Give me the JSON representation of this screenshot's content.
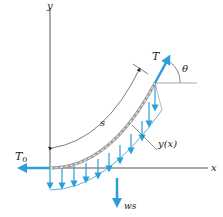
{
  "diagram": {
    "colors": {
      "axis": "#555555",
      "arrow": "#2a9fd8",
      "cable": "#888888",
      "text": "#222222"
    },
    "labels": {
      "y_axis": "y",
      "x_axis": "x",
      "tension": "T",
      "angle": "θ",
      "arc_length": "s",
      "curve": "y(x)",
      "horizontal_tension": "T",
      "horizontal_tension_sub": "0",
      "weight": "ws"
    }
  }
}
